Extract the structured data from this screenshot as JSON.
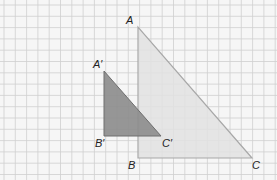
{
  "figure": {
    "grid": {
      "spacing": 11.3,
      "offset_x": 4,
      "offset_y": 5,
      "color": "#cfcfcf",
      "background": "#f6f6f6"
    },
    "large_triangle": {
      "name": "ABC",
      "fill": "#e2e2e2",
      "stroke": "#a8a8a8",
      "vertices": {
        "A": [
          138,
          27
        ],
        "B": [
          138,
          158
        ],
        "C": [
          252,
          158
        ]
      },
      "labels": {
        "A": "A",
        "B": "B",
        "C": "C"
      }
    },
    "small_triangle": {
      "name": "A'B'C'",
      "fill": "#8c8c8c",
      "stroke": "#6e6e6e",
      "vertices": {
        "A'": [
          104,
          71
        ],
        "B'": [
          104,
          136
        ],
        "C'": [
          161,
          136
        ]
      },
      "labels": {
        "A_prime": "A′",
        "B_prime": "B′",
        "C_prime": "C′"
      }
    }
  }
}
